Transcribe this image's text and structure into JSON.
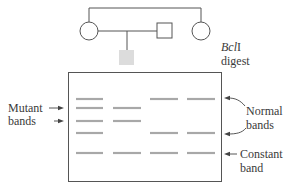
{
  "pedigree": {
    "members": [
      {
        "id": "grandmother-left",
        "shape": "circle",
        "sex": "female",
        "affected": false
      },
      {
        "id": "father",
        "shape": "square",
        "sex": "male",
        "affected": false
      },
      {
        "id": "mother-right",
        "shape": "circle",
        "sex": "female",
        "affected": false
      },
      {
        "id": "child",
        "shape": "square",
        "sex": "unknown",
        "affected": true,
        "fill": "#dcdcdc"
      }
    ]
  },
  "labels": {
    "enzyme": "Bcl",
    "enzyme_suffix": "I",
    "digest": "digest",
    "mutant_line1": "Mutant",
    "mutant_line2": "bands",
    "normal_line1": "Normal",
    "normal_line2": "bands",
    "constant_line1": "Constant",
    "constant_line2": "band"
  },
  "gel": {
    "lanes": 4,
    "band_color": "#a8a8a8",
    "rows": [
      {
        "y": 99,
        "lanes_present": [
          1,
          3,
          4
        ],
        "type": "normal"
      },
      {
        "y": 108,
        "lanes_present": [
          1,
          2
        ],
        "type": "mutant"
      },
      {
        "y": 121,
        "lanes_present": [
          1,
          2
        ],
        "type": "mutant"
      },
      {
        "y": 133,
        "lanes_present": [
          1,
          3,
          4
        ],
        "type": "normal"
      },
      {
        "y": 153,
        "lanes_present": [
          1,
          2,
          3,
          4
        ],
        "type": "constant"
      }
    ]
  },
  "colors": {
    "line": "#555555",
    "band": "#a8a8a8",
    "affected_fill": "#dcdcdc"
  }
}
